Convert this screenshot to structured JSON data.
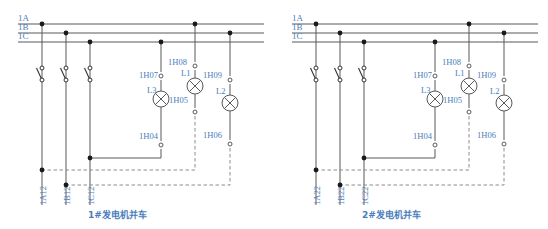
{
  "figure": {
    "text_color": "#4a7ebb",
    "wire_color": "#595959",
    "dashed_color": "#8c8c8c"
  },
  "diagrams": [
    {
      "id": "diagram-1",
      "caption": "1#发电机并车",
      "buses": [
        {
          "label": "1A"
        },
        {
          "label": "1B"
        },
        {
          "label": "1C"
        }
      ],
      "switches": [
        {
          "name": "switch-a"
        },
        {
          "name": "switch-b"
        },
        {
          "name": "switch-c"
        }
      ],
      "outgoing": [
        {
          "label": "1A12"
        },
        {
          "label": "1B12"
        },
        {
          "label": "1C12"
        }
      ],
      "terminals": [
        {
          "label": "1H08"
        },
        {
          "label": "1H07"
        },
        {
          "label": "1H09"
        },
        {
          "label": "1H05"
        },
        {
          "label": "1H04"
        },
        {
          "label": "1H06"
        }
      ],
      "lamps": [
        {
          "label": "L1"
        },
        {
          "label": "L2"
        },
        {
          "label": "L3"
        }
      ]
    },
    {
      "id": "diagram-2",
      "caption": "2#发电机并车",
      "buses": [
        {
          "label": "1A"
        },
        {
          "label": "1B"
        },
        {
          "label": "1C"
        }
      ],
      "switches": [
        {
          "name": "switch-a"
        },
        {
          "name": "switch-b"
        },
        {
          "name": "switch-c"
        }
      ],
      "outgoing": [
        {
          "label": "1A22"
        },
        {
          "label": "1B22"
        },
        {
          "label": "1C22"
        }
      ],
      "terminals": [
        {
          "label": "1H08"
        },
        {
          "label": "1H07"
        },
        {
          "label": "1H09"
        },
        {
          "label": "1H05"
        },
        {
          "label": "1H04"
        },
        {
          "label": "1H06"
        }
      ],
      "lamps": [
        {
          "label": "L1"
        },
        {
          "label": "L2"
        },
        {
          "label": "L3"
        }
      ]
    }
  ]
}
